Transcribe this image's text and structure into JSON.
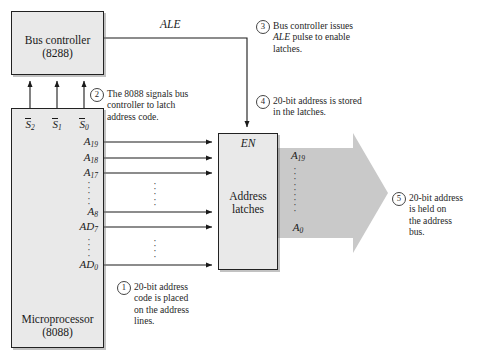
{
  "figure": {
    "background_color": "#ffffff",
    "box_fill_color": "#e9e9e9",
    "box_border_color": "#222222",
    "bus_arrow_color": "#c9c9c9"
  },
  "blocks": {
    "bus_controller": {
      "name": "Bus controller",
      "part": "(8288)"
    },
    "microprocessor": {
      "name": "Microprocessor",
      "part": "(8088)"
    },
    "address_latches": {
      "line1": "Address",
      "line2": "latches",
      "enable_label": "EN"
    }
  },
  "signals": {
    "ale_label": "ALE",
    "status": [
      {
        "base": "S",
        "sub": "2",
        "overbar": true
      },
      {
        "base": "S",
        "sub": "1",
        "overbar": true
      },
      {
        "base": "S",
        "sub": "0",
        "overbar": true
      }
    ],
    "address_pins": [
      {
        "label": "A",
        "sub": "19"
      },
      {
        "label": "A",
        "sub": "18"
      },
      {
        "label": "A",
        "sub": "17"
      },
      {
        "label": "A",
        "sub": "8"
      },
      {
        "label": "AD",
        "sub": "7"
      },
      {
        "label": "AD",
        "sub": "0"
      }
    ],
    "ellipsis_glyph": "·"
  },
  "address_bus": {
    "top_label": {
      "base": "A",
      "sub": "19"
    },
    "bottom_label": {
      "base": "A",
      "sub": "0"
    },
    "width_bits": 20
  },
  "callouts": [
    {
      "number": "1",
      "lines": [
        "20-bit address",
        "code is placed",
        "on the address",
        "lines."
      ]
    },
    {
      "number": "2",
      "lines": [
        "The 8088 signals bus",
        "controller to latch",
        "address code."
      ]
    },
    {
      "number": "3",
      "lines": [
        "Bus controller issues",
        "ALE pulse to enable",
        "latches."
      ],
      "italic_token": "ALE"
    },
    {
      "number": "4",
      "lines": [
        "20-bit address is stored",
        "in the latches."
      ]
    },
    {
      "number": "5",
      "lines": [
        "20-bit address",
        "is held on",
        "the address",
        "bus."
      ]
    }
  ]
}
